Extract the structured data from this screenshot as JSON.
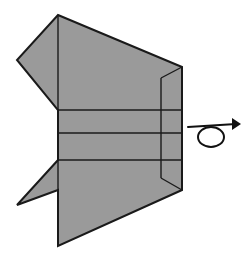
{
  "figure": {
    "kind": "origami-diagram",
    "title": "Origami step diagram: flat-folded model with turn-over instruction",
    "canvas": {
      "width": 244,
      "height": 265,
      "background": "#ffffff"
    },
    "style": {
      "paper_fill": "#9a9a9a",
      "outline_color": "#1a1a1a",
      "outline_width": 2.0,
      "crease_color": "#1a1a1a",
      "crease_width": 1.4,
      "symbol_color": "#111111",
      "symbol_width": 2.0
    },
    "shapes": {
      "body_outline": {
        "name": "folded-paper-body",
        "points": "58,15 182,67 182,190 58,246 58,190 17,205 58,160 58,110 17,60"
      },
      "upper_wing": {
        "name": "upper-left-wing-flap",
        "points": "58,15 58,110 17,60"
      },
      "lower_wing": {
        "name": "lower-left-wing-flap",
        "points": "58,246 58,160 17,205"
      },
      "right_flap_panel": {
        "name": "right-side-flap-panel",
        "points": "182,67 182,190 161,178 161,78"
      }
    },
    "creases": [
      {
        "name": "center-spine-crease",
        "x1": 58,
        "y1": 15,
        "x2": 58,
        "y2": 246
      },
      {
        "name": "upper-band-crease",
        "x1": 58,
        "y1": 110,
        "x2": 182,
        "y2": 110
      },
      {
        "name": "middle-band-crease",
        "x1": 58,
        "y1": 133,
        "x2": 182,
        "y2": 133
      },
      {
        "name": "lower-band-crease",
        "x1": 58,
        "y1": 160,
        "x2": 182,
        "y2": 160
      },
      {
        "name": "right-inner-vertical-crease",
        "x1": 161,
        "y1": 78,
        "x2": 161,
        "y2": 178
      },
      {
        "name": "right-top-notch-diagonal",
        "x1": 182,
        "y1": 67,
        "x2": 161,
        "y2": 78
      },
      {
        "name": "right-bottom-notch-diagonal",
        "x1": 182,
        "y1": 190,
        "x2": 161,
        "y2": 178
      }
    ],
    "symbol": {
      "name": "turn-over-symbol",
      "meaning": "turn the model over",
      "loop": {
        "cx": 211,
        "cy": 137,
        "rx": 13,
        "ry": 10
      },
      "shaft": {
        "x1": 188,
        "y1": 127,
        "x2": 236,
        "y2": 124
      },
      "arrowhead": "232,118 241,124 232,130"
    }
  }
}
